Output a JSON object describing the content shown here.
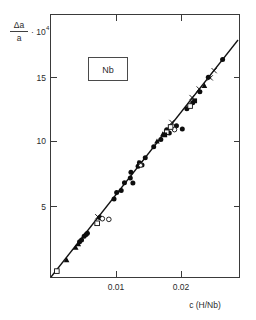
{
  "chart_data": {
    "type": "scatter",
    "title": "",
    "annotation": "Nb",
    "xlabel": "c (H/Nb)",
    "ylabel_numerator": "Δa",
    "ylabel_denominator": "a",
    "ylabel_multiplier": "· 10",
    "ylabel_exponent": "4",
    "xlim": [
      0,
      0.0288
    ],
    "ylim": [
      0,
      18.3
    ],
    "xticks": [
      0.01,
      0.02
    ],
    "xticklabels": [
      "0.01",
      "0.02"
    ],
    "yticks": [
      5,
      10,
      15
    ],
    "yticklabels": [
      "5",
      "10",
      "15"
    ],
    "grid": false,
    "legend": "none",
    "frame": "box",
    "ticks_all_sides": true,
    "fit_line": {
      "label": "linear fit through origin",
      "x": [
        0.0,
        0.0288
      ],
      "y": [
        0.0,
        18.25
      ],
      "slope": 634
    },
    "series": [
      {
        "name": "filled-circle",
        "marker": "filled-circle",
        "points": [
          [
            0.0044,
            2.7
          ],
          [
            0.0047,
            2.82
          ],
          [
            0.0051,
            3.12
          ],
          [
            0.0054,
            3.25
          ],
          [
            0.0056,
            3.34
          ],
          [
            0.0075,
            4.55
          ],
          [
            0.0097,
            5.95
          ],
          [
            0.0101,
            6.45
          ],
          [
            0.0108,
            6.6
          ],
          [
            0.0113,
            7.2
          ],
          [
            0.0122,
            7.55
          ],
          [
            0.0126,
            7.18
          ],
          [
            0.0123,
            8.0
          ],
          [
            0.0134,
            8.45
          ],
          [
            0.0136,
            8.72
          ],
          [
            0.014,
            8.55
          ],
          [
            0.0145,
            9.1
          ],
          [
            0.0158,
            9.95
          ],
          [
            0.0169,
            10.5
          ],
          [
            0.0178,
            11.25
          ],
          [
            0.0182,
            11.0
          ],
          [
            0.0193,
            11.55
          ],
          [
            0.0202,
            11.3
          ],
          [
            0.0209,
            12.85
          ],
          [
            0.0218,
            13.3
          ],
          [
            0.0229,
            14.15
          ],
          [
            0.0242,
            15.25
          ],
          [
            0.0264,
            16.6
          ]
        ]
      },
      {
        "name": "open-circle",
        "marker": "open-circle",
        "points": [
          [
            0.0079,
            4.45
          ],
          [
            0.0089,
            4.4
          ],
          [
            0.0138,
            8.55
          ],
          [
            0.019,
            11.25
          ]
        ]
      },
      {
        "name": "filled-triangle",
        "marker": "filled-triangle",
        "points": [
          [
            0.0024,
            1.3
          ],
          [
            0.0038,
            2.25
          ],
          [
            0.0042,
            2.52
          ],
          [
            0.0163,
            10.35
          ],
          [
            0.0172,
            10.9
          ],
          [
            0.0236,
            14.6
          ]
        ]
      },
      {
        "name": "open-square",
        "marker": "open-square",
        "points": [
          [
            0.0009,
            0.45
          ],
          [
            0.0071,
            4.1
          ],
          [
            0.0178,
            11.05
          ],
          [
            0.0184,
            11.45
          ],
          [
            0.0214,
            13.05
          ]
        ]
      },
      {
        "name": "filled-square",
        "marker": "filled-square",
        "points": [
          [
            0.0175,
            10.85
          ],
          [
            0.0221,
            13.45
          ]
        ]
      },
      {
        "name": "cross",
        "marker": "cross",
        "points": [
          [
            0.0072,
            4.6
          ],
          [
            0.0138,
            8.7
          ],
          [
            0.0186,
            11.8
          ],
          [
            0.0217,
            13.7
          ],
          [
            0.0228,
            14.35
          ],
          [
            0.0245,
            15.2
          ],
          [
            0.0251,
            15.75
          ]
        ]
      }
    ]
  }
}
